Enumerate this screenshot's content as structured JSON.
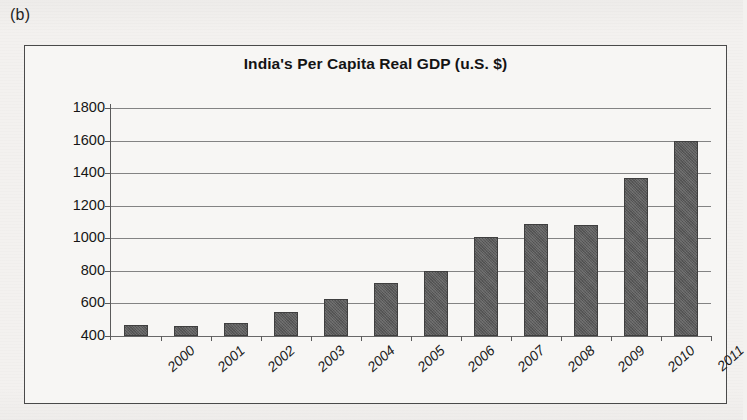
{
  "panel": {
    "label": "(b)"
  },
  "chart_data": {
    "type": "bar",
    "title": "India's Per Capita Real GDP (u.S. $)",
    "xlabel": "",
    "ylabel": "",
    "categories": [
      "2000",
      "2001",
      "2002",
      "2003",
      "2004",
      "2005",
      "2006",
      "2007",
      "2008",
      "2009",
      "2010",
      "2011"
    ],
    "values": [
      465,
      462,
      482,
      548,
      628,
      727,
      800,
      1010,
      1090,
      1082,
      1370,
      1600
    ],
    "ylim": [
      400,
      1800
    ],
    "ytick_labels": [
      "1800",
      "1600",
      "1400",
      "1200",
      "1000",
      "800",
      "600",
      "400"
    ],
    "ytick_values": [
      1800,
      1600,
      1400,
      1200,
      1000,
      800,
      600,
      400
    ],
    "grid": true,
    "legend": null,
    "series": [
      {
        "name": "Per Capita Real GDP",
        "values": [
          465,
          462,
          482,
          548,
          628,
          727,
          800,
          1010,
          1090,
          1082,
          1370,
          1600
        ]
      }
    ],
    "colors": {
      "bar": "#5b5b5b",
      "grid": "#6e6e6e",
      "frame": "#4a4a4a",
      "background": "#f7f6f4"
    }
  }
}
